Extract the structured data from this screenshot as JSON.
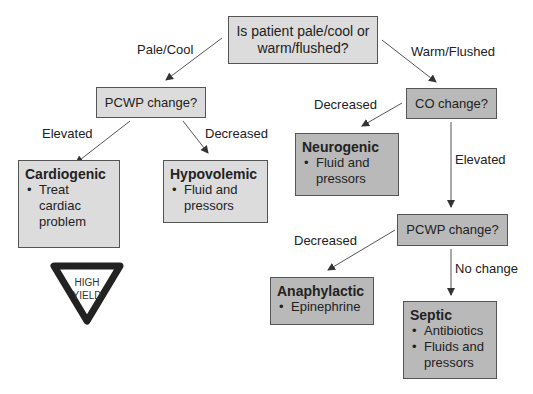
{
  "question": "Is patient pale/cool or warm/flushed?",
  "branches": {
    "left": "Pale/Cool",
    "right": "Warm/Flushed"
  },
  "pcwp_left": {
    "label": "PCWP change?",
    "elevated": "Elevated",
    "decreased": "Decreased"
  },
  "co": {
    "label": "CO change?",
    "decreased": "Decreased",
    "elevated": "Elevated"
  },
  "pcwp_right": {
    "label": "PCWP change?",
    "decreased": "Decreased",
    "no_change": "No change"
  },
  "outcomes": {
    "cardiogenic": {
      "title": "Cardiogenic",
      "items": [
        "Treat cardiac problem"
      ]
    },
    "hypovolemic": {
      "title": "Hypovolemic",
      "items": [
        "Fluid and pressors"
      ]
    },
    "neurogenic": {
      "title": "Neurogenic",
      "items": [
        "Fluid and pressors"
      ]
    },
    "anaphylactic": {
      "title": "Anaphylactic",
      "items": [
        "Epinephrine"
      ]
    },
    "septic": {
      "title": "Septic",
      "items": [
        "Antibiotics",
        "Fluids and pressors"
      ]
    }
  },
  "badge": {
    "line1": "HIGH",
    "line2": "YIELD"
  }
}
